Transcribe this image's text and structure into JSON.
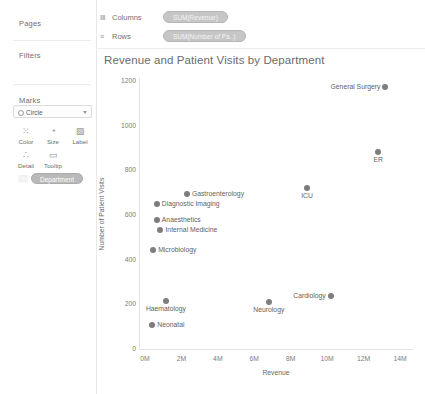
{
  "left_panel": {
    "pages_label": "Pages",
    "filters_label": "Filters",
    "marks_label": "Marks",
    "marks_type": "Circle",
    "mark_buttons": [
      {
        "name": "color",
        "label": "Color",
        "icon": "color-icon",
        "glyph": "⁙"
      },
      {
        "name": "size",
        "label": "Size",
        "icon": "size-icon",
        "glyph": "◔"
      },
      {
        "name": "label",
        "label": "Label",
        "icon": "label-icon",
        "glyph": "▧"
      },
      {
        "name": "detail",
        "label": "Detail",
        "icon": "detail-icon",
        "glyph": "∴"
      },
      {
        "name": "tooltip",
        "label": "Tooltip",
        "icon": "tooltip-icon",
        "glyph": "▭"
      }
    ],
    "marks_pill": "Department",
    "marks_pill_prefix": "░░"
  },
  "shelves": {
    "columns_label": "Columns",
    "columns_icon_glyph": "‖‖",
    "columns_pill": "SUM(Revenue)",
    "rows_label": "Rows",
    "rows_icon_glyph": "≡",
    "rows_pill": "SUM(Number of Pa..)"
  },
  "chart_data": {
    "type": "scatter",
    "title": "Revenue and Patient Visits by Department",
    "xlabel": "Revenue",
    "ylabel": "Number of Patient Visits",
    "xlim": [
      0,
      14800000
    ],
    "ylim": [
      0,
      1250
    ],
    "grid": false,
    "legend": "none",
    "x_ticks": [
      "0M",
      "2M",
      "4M",
      "6M",
      "8M",
      "10M",
      "12M",
      "14M"
    ],
    "x_tick_values": [
      0,
      2000000,
      4000000,
      6000000,
      8000000,
      10000000,
      12000000,
      14000000
    ],
    "y_ticks": [
      "0",
      "200",
      "400",
      "600",
      "800",
      "1000",
      "1200"
    ],
    "y_tick_values": [
      0,
      200,
      400,
      600,
      800,
      1000,
      1200
    ],
    "point_color": "#7d7d7d",
    "points": [
      {
        "label": "General Surgery",
        "x": 13200000,
        "y": 1167,
        "label_pos": "left"
      },
      {
        "label": "ER",
        "x": 12800000,
        "y": 877,
        "label_pos": "below"
      },
      {
        "label": "ICU",
        "x": 8900000,
        "y": 717,
        "label_pos": "below"
      },
      {
        "label": "Gastroenterology",
        "x": 2300000,
        "y": 688,
        "label_pos": "right"
      },
      {
        "label": "Diagnostic Imaging",
        "x": 650000,
        "y": 643,
        "label_pos": "right"
      },
      {
        "label": "Anaesthetics",
        "x": 650000,
        "y": 572,
        "label_pos": "right"
      },
      {
        "label": "Internal Medicine",
        "x": 850000,
        "y": 527,
        "label_pos": "right"
      },
      {
        "label": "Microbiology",
        "x": 450000,
        "y": 438,
        "label_pos": "right"
      },
      {
        "label": "Haematology",
        "x": 1150000,
        "y": 210,
        "label_pos": "below"
      },
      {
        "label": "Neurology",
        "x": 6800000,
        "y": 205,
        "label_pos": "below"
      },
      {
        "label": "Cardiology",
        "x": 10200000,
        "y": 232,
        "label_pos": "left"
      },
      {
        "label": "Neonatal",
        "x": 400000,
        "y": 102,
        "label_pos": "right"
      }
    ]
  }
}
